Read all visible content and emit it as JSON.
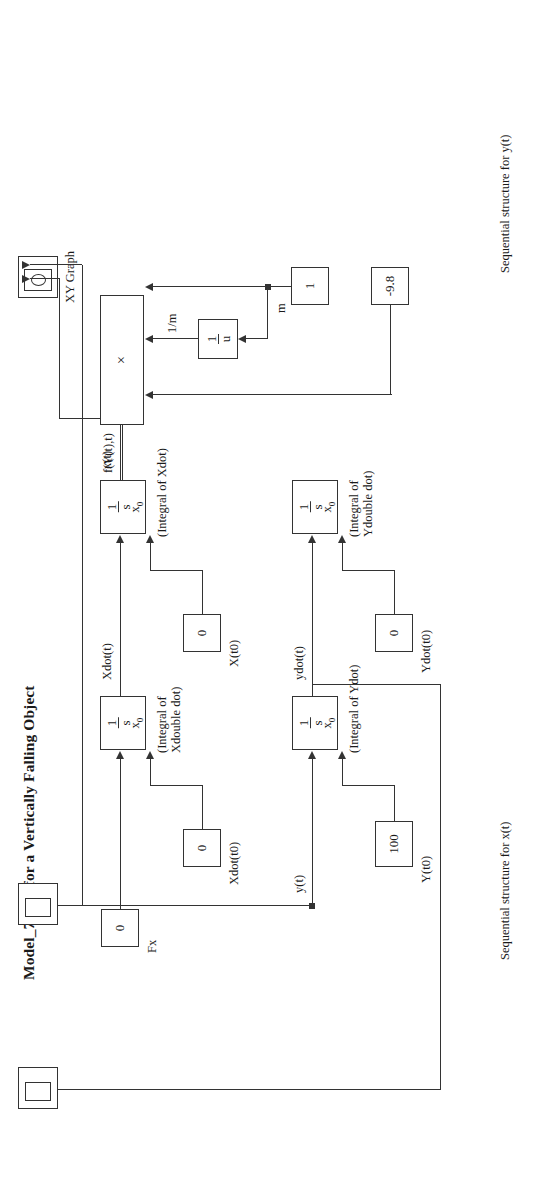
{
  "figure": {
    "title": "Model_7_2_1 for a Vertically Falling Object",
    "captions": {
      "x_structure": "Sequential structure for x(t)",
      "y_structure": "Sequential structure for y(t)"
    }
  },
  "blocks": {
    "fx_const": {
      "value": "0",
      "label": "Fx"
    },
    "xdot_ic_const": {
      "value": "0",
      "label": "Xdot(t0)"
    },
    "x_ic_const": {
      "value": "0",
      "label": "X(t0)"
    },
    "ydot_ic_const": {
      "value": "0",
      "label": "Ydot(t0)"
    },
    "y_ic_const": {
      "value": "100",
      "label": "Y(t0)"
    },
    "mass_const": {
      "value": "1",
      "label": "m"
    },
    "gravity_const": {
      "value": "-9.8",
      "label": ""
    },
    "reciprocal": {
      "numerator": "1",
      "denominator": "u",
      "output_label": "1/m"
    },
    "product": {
      "symbol": "×",
      "output_label": "f(Y(t),t)"
    },
    "integrator_xdd": {
      "numerator": "1",
      "denominator": "s",
      "ic_label": "x",
      "ic_sub": "0",
      "note_line1": "(Integral of",
      "note_line2": "Xdouble dot)",
      "output_label": "Xdot(t)"
    },
    "integrator_xd": {
      "numerator": "1",
      "denominator": "s",
      "ic_label": "x",
      "ic_sub": "0",
      "note_line1": "(Integral of Xdot)",
      "note_line2": "",
      "output_label": "x(t)"
    },
    "integrator_ydd": {
      "numerator": "1",
      "denominator": "s",
      "ic_label": "x",
      "ic_sub": "0",
      "note_line1": "(Integral of",
      "note_line2": "Ydouble dot)",
      "output_label": "ydot(t)"
    },
    "integrator_yd": {
      "numerator": "1",
      "denominator": "s",
      "ic_label": "x",
      "ic_sub": "0",
      "note_line1": "(Integral of Ydot)",
      "note_line2": "",
      "output_label": "y(t)"
    },
    "xy_graph": {
      "label": "XY Graph",
      "icon": "xy-graph-icon"
    },
    "scope_y": {
      "label": "",
      "icon": "scope-icon"
    },
    "scope_ydot": {
      "label": "",
      "icon": "scope-icon"
    }
  },
  "colors": {
    "line": "#333333",
    "text": "#1a1a1a",
    "background": "#ffffff"
  }
}
